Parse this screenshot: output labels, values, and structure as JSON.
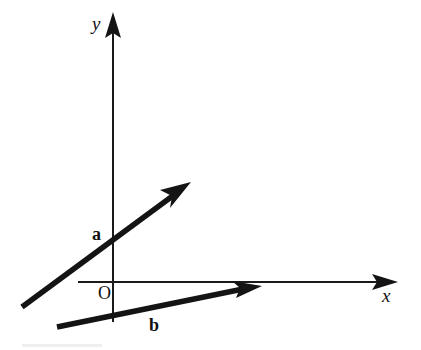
{
  "figure": {
    "title": "",
    "type": "vector-diagram",
    "background_color": "#ffffff",
    "ink_color": "#141414",
    "width": 421,
    "height": 350
  },
  "axes": {
    "origin": {
      "label": "O",
      "x": 113,
      "y": 282,
      "label_x": 98,
      "label_y": 299
    },
    "x_axis": {
      "label": "x",
      "label_x": 382,
      "label_y": 302,
      "start_x": 78,
      "start_y": 282,
      "end_x": 398,
      "end_y": 282,
      "arrow": "right"
    },
    "y_axis": {
      "label": "y",
      "label_x": 92,
      "label_y": 30,
      "start_x": 113,
      "start_y": 322,
      "end_x": 113,
      "end_y": 12,
      "arrow": "up"
    }
  },
  "vectors": [
    {
      "name": "a",
      "label": "a",
      "label_x": 92,
      "label_y": 240,
      "tail_x": 22,
      "tail_y": 307,
      "tip_x": 191,
      "tip_y": 182,
      "arrow": "tip"
    },
    {
      "name": "b",
      "label": "b",
      "label_x": 149,
      "label_y": 331,
      "tail_x": 57,
      "tail_y": 327,
      "tip_x": 262,
      "tip_y": 286,
      "arrow": "tip"
    }
  ],
  "artifacts": {
    "bottom_smudge": {
      "x": 22,
      "y": 344,
      "width": 80,
      "height": 4
    }
  }
}
